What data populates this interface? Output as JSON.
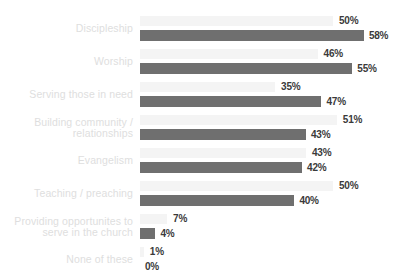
{
  "chart_data": {
    "type": "bar",
    "title": "",
    "subtitle": "",
    "xlabel": "",
    "ylabel": "",
    "orientation": "horizontal",
    "grid": false,
    "legend": "none",
    "xlim": [
      0,
      60
    ],
    "value_suffix": "%",
    "colors": {
      "light_bar": "#f4f4f4",
      "dark_bar": "#6f6f6f",
      "label_text": "#dedede",
      "value_text": "#3a3a3a",
      "background": "#ffffff"
    },
    "categories": [
      "Discipleship",
      "Worship",
      "Serving those in need",
      "Building community /\nrelationships",
      "Evangelism",
      "Teaching / preaching",
      "Providing opportunites to\nserve in the church",
      "None of these"
    ],
    "series": [
      {
        "name": "light",
        "values": [
          50,
          46,
          35,
          51,
          43,
          50,
          7,
          1
        ],
        "labels": [
          "50%",
          "46%",
          "35%",
          "51%",
          "43%",
          "50%",
          "7%",
          "1%"
        ]
      },
      {
        "name": "dark",
        "values": [
          58,
          55,
          47,
          43,
          42,
          40,
          4,
          0
        ],
        "labels": [
          "58%",
          "55%",
          "47%",
          "43%",
          "42%",
          "40%",
          "4%",
          "0%"
        ]
      }
    ]
  }
}
